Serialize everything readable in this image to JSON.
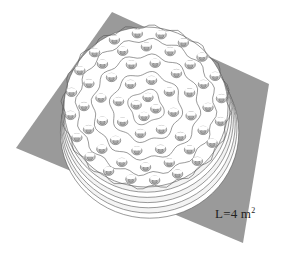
{
  "figure": {
    "type": "3d-surface-plot",
    "label": {
      "prefix": "L=4 m",
      "superscript": "2"
    },
    "colors": {
      "base_plane": "#9a9a9a",
      "surface": "#ffffff",
      "bump_shade": "#c8c8c8",
      "bump_shade_dark": "#a8a8a8",
      "contour_line": "#555555"
    },
    "base_plane_corners": [
      [
        112,
        12
      ],
      [
        269,
        84
      ],
      [
        243,
        243
      ],
      [
        16,
        148
      ]
    ],
    "dome": {
      "cx": 146,
      "cy": 107,
      "rx": 82,
      "ry": 80
    },
    "rim_rings": 6,
    "bump_rings": [
      {
        "r": 10,
        "count": 4
      },
      {
        "r": 28,
        "count": 8
      },
      {
        "r": 46,
        "count": 12
      },
      {
        "r": 62,
        "count": 16
      },
      {
        "r": 76,
        "count": 20
      }
    ]
  }
}
